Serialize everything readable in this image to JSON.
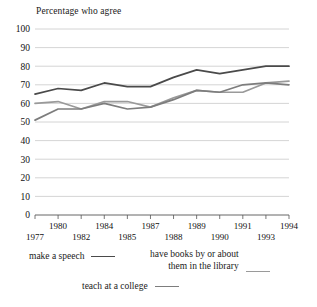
{
  "chart_data": {
    "type": "line",
    "title": "Percentage who agree",
    "xlabel": "",
    "ylabel": "Percentage who agree",
    "ylim": [
      0,
      100
    ],
    "ytick_step": 10,
    "yticks": [
      100,
      90,
      80,
      70,
      60,
      50,
      40,
      30,
      20,
      10,
      0
    ],
    "grid": true,
    "legend_position": "below",
    "categories": [
      "1977",
      "1980",
      "1982",
      "1984",
      "1985",
      "1987",
      "1988",
      "1989",
      "1990",
      "1991",
      "1993",
      "1994"
    ],
    "xticks_top_row": [
      "1980",
      "1984",
      "1987",
      "1989",
      "1991",
      "1994"
    ],
    "xticks_bottom_row": [
      "1977",
      "1982",
      "1985",
      "1988",
      "1990",
      "1993"
    ],
    "series": [
      {
        "name": "make a speech",
        "color": "#4a4a4a",
        "values": [
          65,
          68,
          67,
          71,
          69,
          69,
          74,
          78,
          76,
          78,
          80,
          80
        ]
      },
      {
        "name": "have books by or about them in the library",
        "color": "#9a9a9a",
        "values": [
          60,
          61,
          57,
          61,
          61,
          58,
          63,
          67,
          66,
          66,
          71,
          72
        ]
      },
      {
        "name": "teach at a college",
        "color": "#7d7d7d",
        "values": [
          51,
          57,
          57,
          60,
          57,
          58,
          62,
          67,
          66,
          70,
          71,
          70
        ]
      }
    ]
  },
  "legend": {
    "items": [
      {
        "label": "make a speech",
        "color": "#4a4a4a"
      },
      {
        "label_line1": "have books by or about",
        "label_line2": "them in the library",
        "color": "#9a9a9a"
      },
      {
        "label": "teach at a college",
        "color": "#7d7d7d"
      }
    ]
  },
  "colors": {
    "grid": "#c9c9c9",
    "axis": "#555555",
    "text": "#111111",
    "background": "#ffffff"
  }
}
